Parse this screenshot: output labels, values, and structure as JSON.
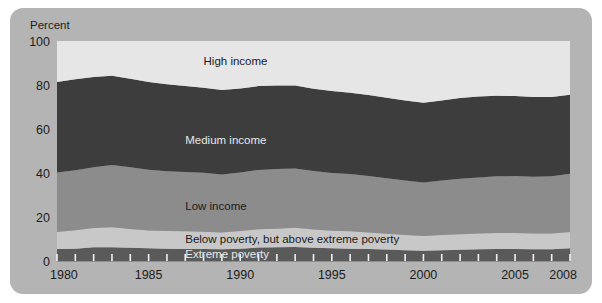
{
  "chart_data": {
    "type": "area",
    "stacked": true,
    "title": "",
    "subtitle": "",
    "xlabel": "",
    "ylabel": "Percent",
    "ylim": [
      0,
      100
    ],
    "xlim": [
      1980,
      2008
    ],
    "grid": false,
    "legend_position": "inline-labels",
    "y_ticks": [
      0,
      20,
      40,
      60,
      80,
      100
    ],
    "y_tick_labels": [
      "0",
      "20",
      "40",
      "60",
      "80",
      "100"
    ],
    "x_tick_labels": [
      "1980",
      "1985",
      "1990",
      "1995",
      "2000",
      "2005",
      "2008"
    ],
    "x_tick_values": [
      1980,
      1985,
      1990,
      1995,
      2000,
      2005,
      2008
    ],
    "x_minor_ticks": [
      1981,
      1982,
      1983,
      1984,
      1986,
      1987,
      1988,
      1989,
      1991,
      1992,
      1993,
      1994,
      1996,
      1997,
      1998,
      1999,
      2001,
      2002,
      2003,
      2004,
      2006,
      2007
    ],
    "x": [
      1980,
      1981,
      1982,
      1983,
      1984,
      1985,
      1986,
      1987,
      1988,
      1989,
      1990,
      1991,
      1992,
      1993,
      1994,
      1995,
      1996,
      1997,
      1998,
      1999,
      2000,
      2001,
      2002,
      2003,
      2004,
      2005,
      2006,
      2007,
      2008
    ],
    "series": [
      {
        "name": "Extreme poverty",
        "color": "#5a5a5a",
        "label_color": "#e8e8e8",
        "values": [
          5.5,
          5.6,
          6.2,
          6.3,
          6.0,
          5.8,
          5.6,
          5.5,
          5.5,
          5.3,
          5.6,
          6.1,
          6.2,
          6.4,
          6.0,
          5.8,
          5.6,
          5.4,
          5.2,
          4.9,
          4.7,
          4.9,
          5.1,
          5.3,
          5.4,
          5.4,
          5.3,
          5.3,
          5.8
        ]
      },
      {
        "name": "Below poverty, but above extreme poverty",
        "color": "#c8c8c8",
        "label_color": "#1a1a1a",
        "values": [
          7.7,
          8.4,
          8.8,
          9.0,
          8.6,
          8.1,
          8.0,
          8.0,
          7.8,
          7.6,
          8.0,
          8.3,
          8.5,
          8.7,
          8.3,
          8.0,
          7.9,
          7.6,
          7.2,
          6.9,
          6.7,
          6.9,
          7.1,
          7.2,
          7.3,
          7.3,
          7.2,
          7.2,
          7.4
        ]
      },
      {
        "name": "Low income",
        "color": "#8c8c8c",
        "label_color": "#1a1a1a",
        "values": [
          27.0,
          27.2,
          27.6,
          28.3,
          28.0,
          27.6,
          27.2,
          27.0,
          26.8,
          26.4,
          26.6,
          27.0,
          27.1,
          27.0,
          26.6,
          26.2,
          26.0,
          25.6,
          25.2,
          24.8,
          24.3,
          24.8,
          25.2,
          25.5,
          25.8,
          25.9,
          25.8,
          26.0,
          26.5
        ]
      },
      {
        "name": "Medium income",
        "color": "#3d3d3d",
        "label_color": "#e8e8e8",
        "values": [
          41.2,
          41.4,
          41.0,
          40.6,
          40.2,
          39.9,
          39.5,
          39.0,
          38.6,
          38.4,
          38.2,
          38.1,
          38.0,
          37.7,
          37.4,
          37.3,
          37.0,
          36.8,
          36.6,
          36.4,
          36.2,
          36.4,
          36.7,
          36.8,
          36.6,
          36.4,
          36.2,
          36.0,
          35.9
        ]
      },
      {
        "name": "High income",
        "color": "#e6e6e6",
        "label_color": "#1a1a1a",
        "values": [
          18.6,
          17.4,
          16.4,
          15.8,
          17.2,
          18.6,
          19.7,
          20.5,
          21.3,
          22.3,
          21.6,
          20.5,
          20.2,
          20.2,
          21.7,
          22.7,
          23.5,
          24.6,
          25.8,
          27.0,
          28.1,
          27.0,
          25.9,
          25.2,
          24.9,
          25.0,
          25.5,
          25.5,
          24.4
        ]
      }
    ],
    "series_label_positions": [
      {
        "name": "Extreme poverty",
        "x": 1987.0,
        "y": 3.0
      },
      {
        "name": "Below poverty, but above extreme poverty",
        "x": 1987.0,
        "y": 10.0
      },
      {
        "name": "Low income",
        "x": 1987.0,
        "y": 25.0
      },
      {
        "name": "Medium income",
        "x": 1987.0,
        "y": 55.0
      },
      {
        "name": "High income",
        "x": 1988.0,
        "y": 91.0
      }
    ]
  },
  "panel": {
    "background_color": "#b4b4b4",
    "page_background": "#ffffff"
  }
}
